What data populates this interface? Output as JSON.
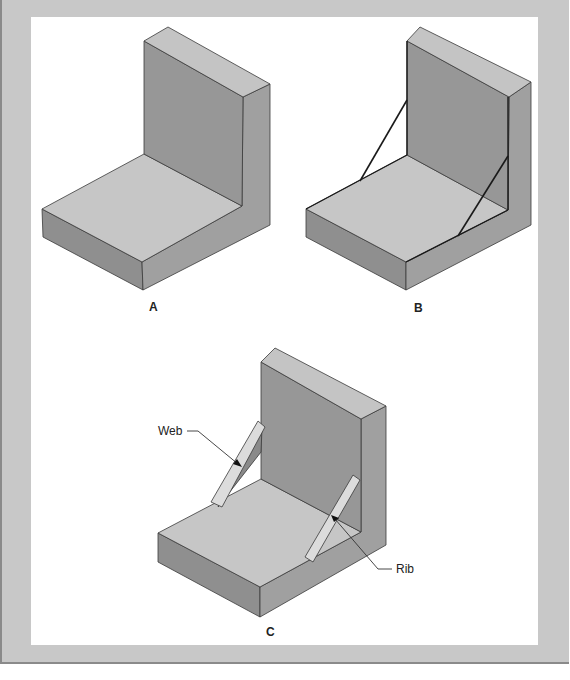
{
  "page": {
    "top_caption_clipped": "",
    "colors": {
      "frame": "#c8c8c8",
      "panel": "#ffffff",
      "face_top": "#c4c4c4",
      "face_front_dark": "#8f8f8f",
      "face_wall": "#979797",
      "face_side": "#a3a3a3",
      "edge": "#333333",
      "strip": "#dcdcdc"
    }
  },
  "figures": [
    {
      "id": "A",
      "label": "A",
      "description": "L-shaped block (base + upright wall)"
    },
    {
      "id": "B",
      "label": "B",
      "description": "L-shaped block with diagonal bracing lines sketched"
    },
    {
      "id": "C",
      "label": "C",
      "description": "L-shaped block with web and rib reinforcements",
      "callouts": [
        {
          "text": "Web"
        },
        {
          "text": "Rib"
        }
      ]
    }
  ]
}
